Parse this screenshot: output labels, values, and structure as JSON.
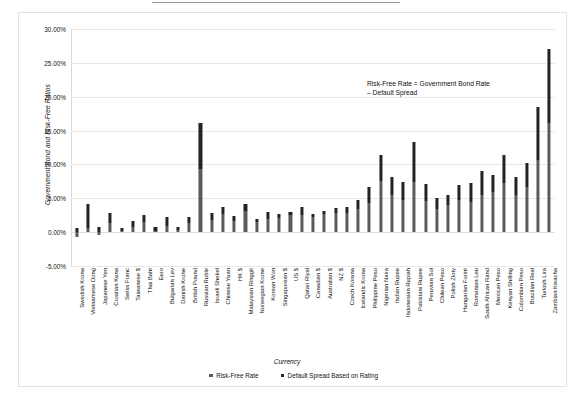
{
  "chart_data": {
    "type": "bar",
    "stacked": true,
    "title": "",
    "xlabel": "Currency",
    "ylabel": "Government Bond and Risk-Free Ratios",
    "ylim": [
      -5,
      30
    ],
    "ytick_labels": [
      "30.00%",
      "25.00%",
      "20.00%",
      "15.00%",
      "10.00%",
      "5.00%",
      "0.00%",
      "-5.00%"
    ],
    "ytick_values": [
      30,
      25,
      20,
      15,
      10,
      5,
      0,
      -5
    ],
    "grid": true,
    "legend_position": "bottom",
    "annotation": "Risk-Free Rate = Government Bond Rate\n– Default Spread",
    "categories": [
      "Swedish Krona",
      "Vietnamese Dong",
      "Japanese Yen",
      "Croatian Kuna",
      "Swiss Franc",
      "Taiwanese $",
      "Thai Baht",
      "Euro",
      "Bulgarian Lev",
      "Danish Krone",
      "British Pound",
      "Russian Ruble",
      "Israeli Shekel",
      "Chinese Yuan",
      "HK $",
      "Malaysian Ringgit",
      "Norwegian Krone",
      "Korean Won",
      "Singaporean $",
      "US $",
      "Qatari Riyal",
      "Canadian $",
      "Australian $",
      "NZ $",
      "Czech Koruna",
      "Icelandic Krona",
      "Philippine Peso",
      "Nigerian Naira",
      "Indian Rupee",
      "Indonesian Rupiah",
      "Pakistani Rupee",
      "Peruvian Sol",
      "Chilean Peso",
      "Polish Zloty",
      "Hungarian Forint",
      "Romanian Leu",
      "South African Rand",
      "Mexican Peso",
      "Kenyan Shilling",
      "Colombian Peso",
      "Brazilian Real",
      "Turkish Lira",
      "Zambian Kwacha"
    ],
    "series": [
      {
        "name": "Risk-Free Rate",
        "values": [
          -0.75,
          0.55,
          -0.4,
          1.3,
          0.15,
          0.8,
          1.55,
          0.2,
          0.95,
          0.3,
          1.3,
          9.3,
          1.75,
          2.7,
          1.6,
          3.05,
          1.55,
          2.0,
          2.05,
          2.6,
          2.6,
          2.25,
          2.65,
          2.9,
          2.85,
          3.35,
          4.35,
          7.6,
          5.55,
          4.7,
          7.45,
          4.55,
          3.45,
          4.0,
          4.8,
          4.45,
          5.45,
          6.0,
          7.25,
          5.45,
          6.65,
          10.6,
          16.15
        ]
      },
      {
        "name": "Default Spread Based on Rating",
        "values": [
          0.6,
          3.6,
          0.75,
          1.5,
          0.4,
          0.8,
          1.0,
          0.55,
          1.25,
          0.4,
          1.0,
          6.85,
          1.05,
          0.95,
          0.8,
          1.1,
          0.4,
          0.95,
          0.6,
          0.4,
          1.05,
          0.4,
          0.4,
          0.6,
          0.9,
          1.35,
          2.35,
          3.85,
          2.55,
          2.65,
          5.9,
          2.55,
          1.65,
          1.55,
          2.2,
          2.85,
          3.55,
          2.5,
          4.1,
          2.75,
          3.6,
          7.95,
          10.85
        ]
      }
    ],
    "series_colors": [
      "#5b5b5b",
      "#232323"
    ]
  },
  "legend": {
    "items": [
      {
        "label": "Risk-Free Rate",
        "color": "#5b5b5b"
      },
      {
        "label": "Default Spread Based on Rating",
        "color": "#232323"
      }
    ]
  }
}
